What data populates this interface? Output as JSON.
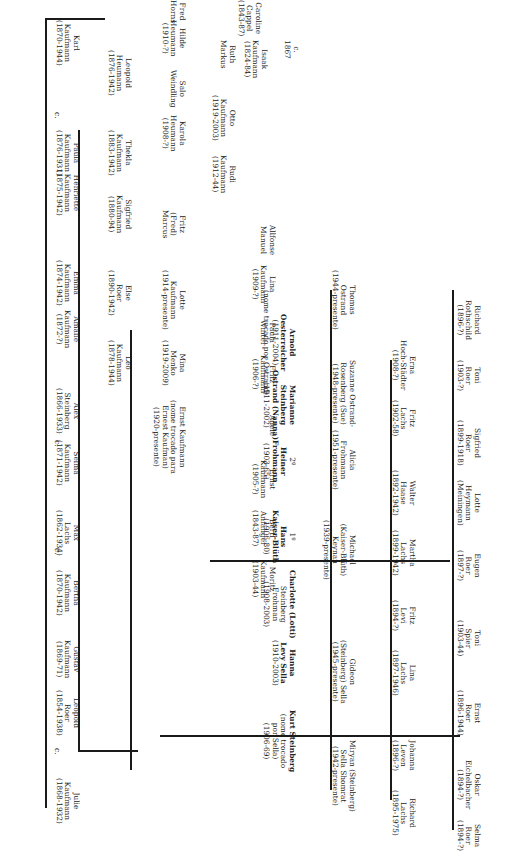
{
  "title_couple": {
    "p1": [
      "Isaak",
      "Kaufmann",
      "(1824-84)"
    ],
    "marriage": [
      "c.",
      "1867"
    ],
    "p2": [
      "Caroline",
      "Cappel",
      "(1843-87)"
    ]
  },
  "people": {
    "julie": [
      "Julie",
      "Kaufmann",
      "(1868-1932)"
    ],
    "leopold_roer": [
      "Leopold",
      "Roer",
      "(1854-1938)"
    ],
    "gustav": [
      "Gustav",
      "Kaufmann",
      "(1869-71)"
    ],
    "bertha": [
      "Bertha",
      "Kaufmann",
      "(1870-1942)"
    ],
    "max_lachs": [
      "Max",
      "Lachs",
      "(1862-1934)"
    ],
    "selma_k": [
      "Selma",
      "Kaufmann",
      "(1871-1942)"
    ],
    "alex": [
      "Alex",
      "Steinberg",
      "(1866-1933)"
    ],
    "amalie": [
      "Amalie",
      "Kaufmann",
      "(1872-?)"
    ],
    "emma": [
      "Emma",
      "Kaufmann",
      "(1874-1942)"
    ],
    "henriette": [
      "Henriette",
      "Kaufmann",
      "(1875-1942)"
    ],
    "paula_k": [
      "Paula",
      "Kaufmann",
      "(1876-1931)"
    ],
    "karl": [
      "Karl",
      "Kaufmann",
      "(1870-1944)"
    ],
    "leo": [
      "Leo",
      "Kaufmann",
      "(1878-1944)"
    ],
    "else": [
      "Else",
      "Roer",
      "(1890-1942)"
    ],
    "sigfried_k": [
      "Sigfried",
      "Kaufmann",
      "(1880-94)"
    ],
    "thekla": [
      "Thekla",
      "Kaufmann",
      "(1883-1942)"
    ],
    "leopold_h": [
      "Leopold",
      "Heumann",
      "(1876-1942)"
    ],
    "karola": [
      "Karola",
      "Heumann",
      "(1908-?)"
    ],
    "salo": [
      "Salo",
      "Weindling"
    ],
    "hilde": [
      "Hilde",
      "Heumann",
      "(1910-?)"
    ],
    "fred": [
      "Fred",
      "Horns"
    ],
    "ernst_kaufman_renamed": [
      "Ernst Kaufmann",
      "(nome trocado para",
      "Ernest Kaufman)",
      "(1920-presente)"
    ],
    "mina": [
      "Mina",
      "Menko",
      "(1919-2009)"
    ],
    "lotte_k": [
      "Lotte",
      "Kaufmann",
      "(1914-presente)"
    ],
    "fritz_marcus": [
      "Fritz",
      "(Fred)",
      "Marcus"
    ],
    "rudi": [
      "Rudi",
      "Kaufmann",
      "(1912-44)"
    ],
    "otto": [
      "Otto",
      "Kaufmann",
      "(1919-2003)"
    ],
    "ruth": [
      "Ruth",
      "Markus"
    ],
    "moritz": [
      "Moritz",
      "Kaufmann",
      "(1903-44)"
    ],
    "bertl": [
      "Bertl",
      "Anfänger",
      "(1843-87)"
    ],
    "ernst_k": [
      "Ernst",
      "Kaufmann",
      "(1905-?)"
    ],
    "adele": [
      "Adele"
    ],
    "fritz_k": [
      "Fritz",
      "Kaufmann",
      "(1906-?)"
    ],
    "paula_w": [
      "Paula",
      "Winter"
    ],
    "lina_k": [
      "Lina",
      "Kaufmann",
      "(1909-?)"
    ],
    "allfonse": [
      "Allfonse",
      "Manuel"
    ],
    "kurt": [
      "Kurt Steinberg",
      "(nome trocado",
      "por Sella)",
      "(1906-69)"
    ],
    "hanna": [
      "Hanna",
      "Levy Sella",
      "(1910-2003)"
    ],
    "charlotte": [
      "Charlotte (Lotti)",
      "Steinberg",
      "Frohman",
      "(1908-2003)"
    ],
    "hans": [
      "1º",
      "Hans",
      "Kaiser-Blüth",
      "(1906-80)"
    ],
    "heiner": [
      "2º",
      "Heiner",
      "Frohmann",
      "(1903-65)"
    ],
    "marianne": [
      "Marianne",
      "Steinberg",
      "Ostrand (Nanna)",
      "(1911-2002)"
    ],
    "arnold": [
      "Arnold",
      "Oesterreicher",
      "(1911-2004)",
      "(nome trocado por Ostrand)"
    ],
    "miryam": [
      "Miryan (Steinberg)",
      "Sella Shomrat",
      "(1942-presente)"
    ],
    "gideon": [
      "Gideon",
      "(Steinberg) Sella",
      "(1945-presente)"
    ],
    "michael": [
      "Michael",
      "(Kaiser-Blüth)",
      "Keynan",
      "(1939-presente)"
    ],
    "alicia": [
      "Alicia",
      "Frohmann",
      "(1951-presente)"
    ],
    "suzanne": [
      "Suzanne Ostrand-",
      "Rosenberg (Sue)",
      "(1948-presente)"
    ],
    "thomas": [
      "Thomas",
      "Ostrand",
      "(1944-presente)"
    ],
    "richard_l": [
      "Richard",
      "Lachs",
      "(1895-1975)"
    ],
    "johanna": [
      "Johanna",
      "Leven",
      "(1896-?)"
    ],
    "lina_l": [
      "Lina",
      "Lachs",
      "(1897-1946)"
    ],
    "fritz_levi": [
      "Fritz",
      "Levi",
      "(1894-?)"
    ],
    "martha": [
      "Martha",
      "Lachs",
      "(1899-1942)"
    ],
    "walter": [
      "Walter",
      "Haase",
      "(1892-1942)"
    ],
    "fritz_l": [
      "Fritz",
      "Lachs",
      "(1902-58)"
    ],
    "erna": [
      "Erna",
      "Hoch-Städter",
      "(1908-?)"
    ],
    "selma_r": [
      "Selma",
      "Roer",
      "(1894-?)"
    ],
    "oskar": [
      "Oskar",
      "Eichelbacher",
      "(1894-?)"
    ],
    "ernst_r": [
      "Ernst",
      "Roer",
      "(1896-1944)"
    ],
    "toni_spier": [
      "Toni",
      "Spier",
      "(1903-44)"
    ],
    "eugen": [
      "Eugen",
      "Roer",
      "(1897-?)"
    ],
    "lotte_h": [
      "Lotte",
      "Heymann",
      "(Meiningen)"
    ],
    "sigfried_r": [
      "Sigfried",
      "Roer",
      "(1899-1918)"
    ],
    "toni_r": [
      "Toni",
      "Roer",
      "(1903-?)"
    ],
    "richard_r": [
      "Richard",
      "Rothschild",
      "(1896-?)"
    ]
  },
  "marriage_marker": "c."
}
